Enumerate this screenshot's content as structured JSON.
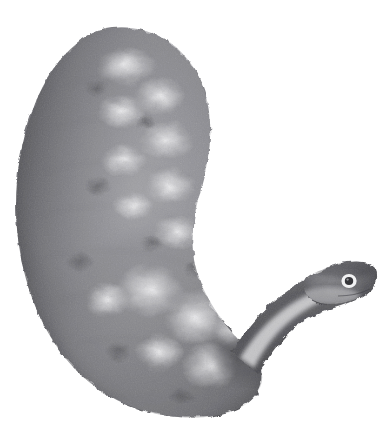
{
  "plate": {
    "caption": "· · ·  · · · · ·",
    "background_color": "#ffffff",
    "width": 388,
    "height": 425
  },
  "figure": {
    "name": "marine-invertebrate-specimen",
    "rendering": "grayscale halftone engraving",
    "orientation": "body arcs from upper-left down to lower-right; head points up and to the right",
    "parts": [
      {
        "label": "body",
        "note": "thick crescent trunk with mottled light blotches and darker rim"
      },
      {
        "label": "neck",
        "note": "slender tapering stalk with pale highlight stripe along its lower edge"
      },
      {
        "label": "head",
        "note": "small rounded head with a single ringed eye near the snout"
      },
      {
        "label": "eye",
        "note": "dark pupil encircled by a white ring"
      }
    ],
    "palette": {
      "darkest": "#3c3c3e",
      "dark": "#56565a",
      "mid": "#7d7d81",
      "light": "#a9a9ad",
      "lightest": "#d6d6d8",
      "highlight": "#ececee",
      "paper": "#ffffff"
    },
    "bounds": {
      "body_left": 12,
      "body_top": 26,
      "body_bottom": 418,
      "head_right": 377,
      "head_top": 252
    }
  }
}
